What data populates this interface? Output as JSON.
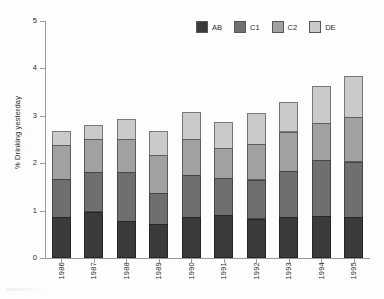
{
  "chart_data": {
    "type": "bar",
    "subtype": "stacked-vertical",
    "title": "",
    "xlabel": "",
    "ylabel": "% Drinking yesterday",
    "ylim": [
      0,
      5
    ],
    "y_ticks": [
      "0",
      "1",
      "2",
      "3",
      "4",
      "5"
    ],
    "grid": false,
    "legend_position": "top-right",
    "categories": [
      "1986",
      "1987",
      "1988",
      "1989",
      "1990",
      "1991",
      "1992",
      "1993",
      "1994",
      "1995"
    ],
    "series": [
      {
        "name": "AB",
        "color": "#3b3b3b",
        "values": [
          0.87,
          0.98,
          0.78,
          0.72,
          0.86,
          0.91,
          0.83,
          0.86,
          0.89,
          0.87
        ]
      },
      {
        "name": "C1",
        "color": "#6f6f6f",
        "values": [
          0.82,
          0.85,
          1.05,
          0.67,
          0.9,
          0.79,
          0.84,
          0.99,
          1.19,
          1.18
        ]
      },
      {
        "name": "C2",
        "color": "#a1a1a1",
        "values": [
          0.72,
          0.72,
          0.72,
          0.81,
          0.78,
          0.66,
          0.76,
          0.85,
          0.8,
          0.95
        ]
      },
      {
        "name": "DE",
        "color": "#cacaca",
        "values": [
          0.32,
          0.31,
          0.43,
          0.52,
          0.6,
          0.55,
          0.67,
          0.65,
          0.81,
          0.9
        ]
      }
    ],
    "totals": [
      2.73,
      2.86,
      2.98,
      2.72,
      3.14,
      2.91,
      3.1,
      3.35,
      3.69,
      3.9
    ]
  },
  "legend": {
    "items": [
      {
        "label": "AB",
        "color": "#3b3b3b"
      },
      {
        "label": "C1",
        "color": "#6f6f6f"
      },
      {
        "label": "C2",
        "color": "#a1a1a1"
      },
      {
        "label": "DE",
        "color": "#cacaca"
      }
    ]
  }
}
